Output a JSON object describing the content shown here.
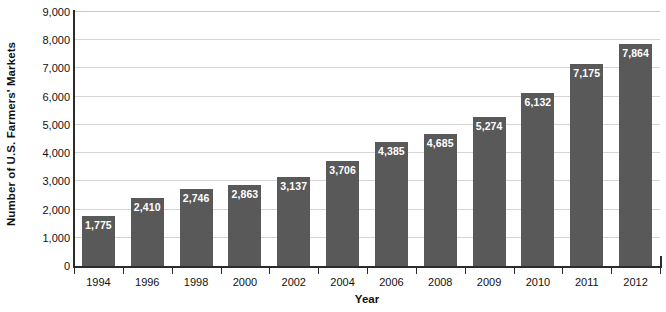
{
  "chart_data": {
    "type": "bar",
    "title": "",
    "xlabel": "Year",
    "ylabel": "Number of U.S. Farmers' Markets",
    "categories": [
      "1994",
      "1996",
      "1998",
      "2000",
      "2002",
      "2004",
      "2006",
      "2008",
      "2009",
      "2010",
      "2011",
      "2012"
    ],
    "values": [
      1775,
      2410,
      2746,
      2863,
      3137,
      3706,
      4385,
      4685,
      5274,
      6132,
      7175,
      7864
    ],
    "value_labels": [
      "1,775",
      "2,410",
      "2,746",
      "2,863",
      "3,137",
      "3,706",
      "4,385",
      "4,685",
      "5,274",
      "6,132",
      "7,175",
      "7,864"
    ],
    "ylim": [
      0,
      9000
    ],
    "ytick_values": [
      0,
      1000,
      2000,
      3000,
      4000,
      5000,
      6000,
      7000,
      8000,
      9000
    ],
    "ytick_labels": [
      "0",
      "1,000",
      "2,000",
      "3,000",
      "4,000",
      "5,000",
      "6,000",
      "7,000",
      "8,000",
      "9,000"
    ],
    "grid": true,
    "legend": null,
    "bar_color": "#595959",
    "value_label_color": "#ffffff",
    "gridline_color": "#d5d5d5",
    "axis_color": "#2b2b2b",
    "background_color": "#ffffff"
  }
}
